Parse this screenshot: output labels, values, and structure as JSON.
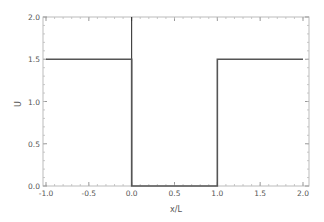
{
  "chart_data": {
    "type": "line",
    "title": "",
    "xlabel": "x/L",
    "ylabel": "U",
    "xlim": [
      -1.0,
      2.0
    ],
    "ylim": [
      0.0,
      2.0
    ],
    "xticks": [
      "-1.0",
      "-0.5",
      "0.0",
      "0.5",
      "1.0",
      "1.5",
      "2.0"
    ],
    "yticks": [
      "0.0",
      "0.5",
      "1.0",
      "1.5",
      "2.0"
    ],
    "grid": false,
    "legend": null,
    "series": [
      {
        "name": "U(x)",
        "x": [
          -1.0,
          0.0,
          0.0,
          1.0,
          1.0,
          2.0
        ],
        "y": [
          1.5,
          1.5,
          0.0,
          0.0,
          1.5,
          1.5
        ],
        "color": "#555555"
      }
    ],
    "annotations": [
      {
        "type": "vertical-line",
        "x": 0.0,
        "color": "#222222"
      }
    ]
  }
}
